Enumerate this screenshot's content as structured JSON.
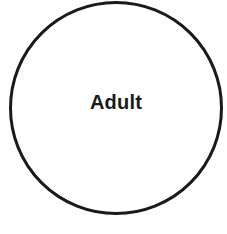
{
  "diagram": {
    "shape": "circle",
    "label": "Adult",
    "stroke_color": "#1a1a1a",
    "fill_color": "#ffffff"
  }
}
